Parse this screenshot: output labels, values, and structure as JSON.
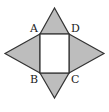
{
  "diagram": {
    "title": "",
    "type": "geometry",
    "colors": {
      "stroke": "#333333",
      "triangle_fill": "#bdbdbd",
      "square_fill": "#ffffff",
      "label": "#222222"
    },
    "square": {
      "vertices": {
        "A": [
          40,
          34
        ],
        "D": [
          69,
          34
        ],
        "C": [
          69,
          73
        ],
        "B": [
          40,
          73
        ]
      }
    },
    "triangles": [
      {
        "name": "top",
        "points": "40,34 54.5,8 69,34"
      },
      {
        "name": "left",
        "points": "40,34 5,53.5 40,73"
      },
      {
        "name": "right",
        "points": "69,34 104,53.5 69,73"
      },
      {
        "name": "bottom",
        "points": "40,73 54.5,98 69,73"
      }
    ],
    "labels": [
      {
        "text": "A",
        "x": 30,
        "y": 32
      },
      {
        "text": "D",
        "x": 71,
        "y": 32
      },
      {
        "text": "B",
        "x": 30,
        "y": 83
      },
      {
        "text": "C",
        "x": 71,
        "y": 83
      }
    ]
  }
}
